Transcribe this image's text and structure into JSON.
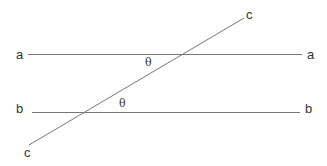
{
  "diagram": {
    "lines": [
      {
        "id": "a",
        "label_left": "a",
        "label_right": "a"
      },
      {
        "id": "b",
        "label_left": "b",
        "label_right": "b"
      },
      {
        "id": "c",
        "label_top": "c",
        "label_bottom": "c"
      }
    ],
    "angles": [
      {
        "label": "θ",
        "between": [
          "a",
          "c"
        ]
      },
      {
        "label": "θ",
        "between": [
          "b",
          "c"
        ]
      }
    ]
  }
}
